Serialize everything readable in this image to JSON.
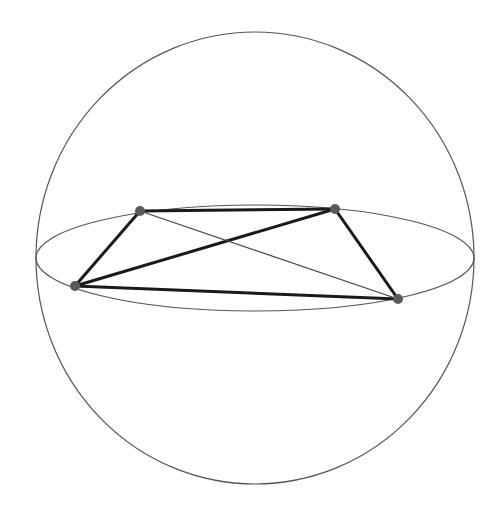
{
  "diagram": {
    "type": "sphere-with-inscribed-quadrilateral",
    "colors": {
      "background": "#ffffff",
      "sphere_outline": "#555555",
      "equator": "#555555",
      "thick_edge": "#1a1a1a",
      "thin_edge": "#444444",
      "vertex": "#5a5a5a"
    },
    "sphere": {
      "cx": 255,
      "cy": 258,
      "rx": 219,
      "ry": 226
    },
    "equator": {
      "cx": 255,
      "cy": 258,
      "rx": 219,
      "ry": 53
    },
    "vertices": [
      {
        "id": "A",
        "x": 140,
        "y": 211
      },
      {
        "id": "B",
        "x": 335,
        "y": 209
      },
      {
        "id": "C",
        "x": 398,
        "y": 299
      },
      {
        "id": "D",
        "x": 75,
        "y": 286
      }
    ],
    "edges": [
      {
        "from": "A",
        "to": "B",
        "style": "thick"
      },
      {
        "from": "B",
        "to": "C",
        "style": "thick"
      },
      {
        "from": "C",
        "to": "D",
        "style": "thick"
      },
      {
        "from": "D",
        "to": "A",
        "style": "thick"
      },
      {
        "from": "D",
        "to": "B",
        "style": "thick"
      },
      {
        "from": "A",
        "to": "C",
        "style": "thin"
      }
    ]
  }
}
